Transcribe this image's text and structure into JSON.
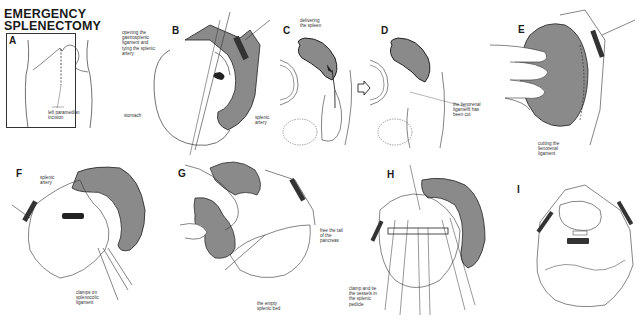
{
  "title": "EMERGENCY\nSPLENECTOMY",
  "title_lines": [
    "EMERGENCY",
    "SPLENECTOMY"
  ],
  "colors": {
    "spleen_fill": "#8a8a8a",
    "outline": "#222222",
    "background": "#ffffff",
    "label_text": "#333333"
  },
  "panels": [
    {
      "id": "A",
      "letter": "A",
      "labels": [
        "left paramedian\nincision"
      ]
    },
    {
      "id": "B",
      "letter": "B",
      "labels": [
        "opening the\ngastrosplenic\nligament and\ntying the splenic\nartery",
        "stomach",
        "splenic\nartery"
      ]
    },
    {
      "id": "C",
      "letter": "C",
      "labels": [
        "delivering\nthe spleen"
      ]
    },
    {
      "id": "D",
      "letter": "D",
      "labels": [
        "the lienorenal\nligament has\nbeen cut"
      ]
    },
    {
      "id": "E",
      "letter": "E",
      "labels": [
        "cutting the\nlienorenal\nligament"
      ]
    },
    {
      "id": "F",
      "letter": "F",
      "labels": [
        "splenic\nartery",
        "clamps on\nsplenocolic\nligament"
      ]
    },
    {
      "id": "G",
      "letter": "G",
      "labels": [
        "free the tail\nof the\npancreas",
        "the empty\nsplenic bed"
      ]
    },
    {
      "id": "H",
      "letter": "H",
      "labels": [
        "clamp and tie\nthe vessels in\nthe splenic\npedicle"
      ]
    },
    {
      "id": "I",
      "letter": "I",
      "labels": []
    }
  ],
  "icons": {
    "transition_arrow": "right-hollow-arrow"
  }
}
